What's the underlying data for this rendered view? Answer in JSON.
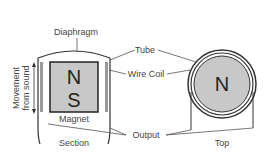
{
  "diagram": {
    "labels": {
      "diaphragm": "Diaphragm",
      "tube": "Tube",
      "wire_coil": "Wire Coil",
      "output": "Output",
      "magnet": "Magnet",
      "section": "Section",
      "top": "Top",
      "movement_line1": "Movement",
      "movement_line2": "from sound"
    },
    "magnet_poles": {
      "section_north": "N",
      "section_south": "S",
      "top_north": "N"
    },
    "colors": {
      "magnet_fill": "#c8c8c8",
      "outline": "#333333",
      "text": "#444444",
      "leader": "#555555"
    }
  }
}
